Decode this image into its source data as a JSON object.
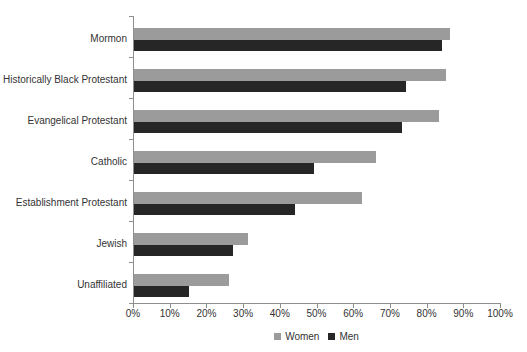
{
  "chart_data": {
    "type": "bar",
    "orientation": "horizontal",
    "title": "",
    "xlabel": "",
    "ylabel": "",
    "categories": [
      "Mormon",
      "Historically Black Protestant",
      "Evangelical Protestant",
      "Catholic",
      "Establishment Protestant",
      "Jewish",
      "Unaffiliated"
    ],
    "series": [
      {
        "name": "Women",
        "color": "#9b9b9b",
        "values": [
          86,
          85,
          83,
          66,
          62,
          31,
          26
        ]
      },
      {
        "name": "Men",
        "color": "#262626",
        "values": [
          84,
          74,
          73,
          49,
          44,
          27,
          15
        ]
      }
    ],
    "x_axis": {
      "min": 0,
      "max": 100,
      "step": 10,
      "tick_labels": [
        "0%",
        "10%",
        "20%",
        "30%",
        "40%",
        "50%",
        "60%",
        "70%",
        "80%",
        "90%",
        "100%"
      ]
    },
    "legend": {
      "position": "bottom-center"
    },
    "grid": "off",
    "axis_color": "#8e8e8e",
    "text_color": "#333333",
    "background": "#ffffff"
  }
}
